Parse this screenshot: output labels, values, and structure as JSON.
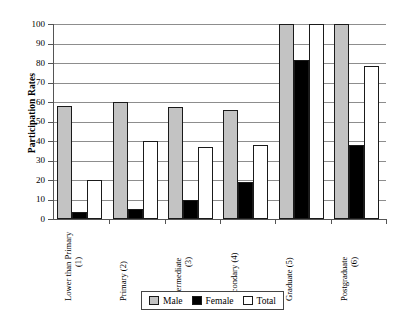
{
  "chart_data": {
    "type": "bar",
    "title": "",
    "subtitle": "",
    "xlabel": "",
    "ylabel": "Participation Rates",
    "ylim": [
      0,
      100
    ],
    "ytick_step": 10,
    "yticks": [
      100,
      90,
      80,
      70,
      60,
      50,
      40,
      30,
      20,
      10,
      0
    ],
    "grid": "horizontal",
    "legend_position": "bottom-center",
    "categories": [
      "Lower than Primary (1)",
      "Primary (2)",
      "Intermediate (3)",
      "Secondary (4)",
      "Graduate (5)",
      "Postgraduate (6)"
    ],
    "category_lines": [
      [
        "Lower than Primary",
        "(1)"
      ],
      [
        "Primary (2)",
        ""
      ],
      [
        "Intermediate",
        "(3)"
      ],
      [
        "Secondary (4)",
        ""
      ],
      [
        "Graduate (5)",
        ""
      ],
      [
        "Postgraduate",
        "(6)"
      ]
    ],
    "series": [
      {
        "name": "Male",
        "color": "#c3c3c3",
        "values": [
          58,
          60,
          57.5,
          56,
          100,
          100
        ]
      },
      {
        "name": "Female",
        "color": "#000000",
        "values": [
          3.5,
          5,
          9.5,
          19,
          81.5,
          38
        ]
      },
      {
        "name": "Total",
        "color": "#ffffff",
        "values": [
          20,
          40,
          37,
          38,
          100,
          78.5
        ]
      }
    ]
  },
  "axis": {
    "y_title": "Participation Rates",
    "y_tick_labels": [
      "100",
      "90",
      "80",
      "70",
      "60",
      "50",
      "40",
      "30",
      "20",
      "10",
      "0"
    ]
  },
  "legend": {
    "items": [
      {
        "label": "Male",
        "swatch": "male"
      },
      {
        "label": "Female",
        "swatch": "female"
      },
      {
        "label": "Total",
        "swatch": "total"
      }
    ]
  }
}
